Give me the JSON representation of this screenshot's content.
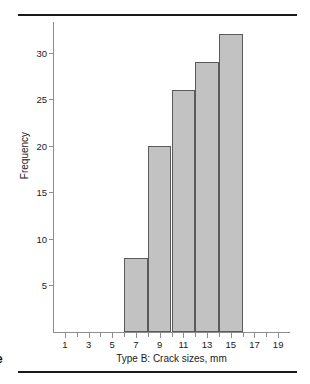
{
  "figure": {
    "margin_glyph": "e",
    "rule_color": "#1a1a1a"
  },
  "chart_data": {
    "type": "bar",
    "title": "",
    "subtitle": "",
    "xlabel": "Type B: Crack sizes, mm",
    "ylabel": "Frequency",
    "bin_edges": [
      6,
      8,
      10,
      12,
      14,
      16
    ],
    "bin_width": 2,
    "categories": [
      "6-8",
      "8-10",
      "10-12",
      "12-14",
      "14-16"
    ],
    "bin_centers": [
      7,
      9,
      11,
      13,
      15
    ],
    "values": [
      8,
      20,
      26,
      29,
      32
    ],
    "xlim": [
      0,
      20
    ],
    "ylim": [
      0,
      33
    ],
    "x_ticks": [
      1,
      2,
      3,
      4,
      5,
      6,
      7,
      8,
      9,
      10,
      11,
      12,
      13,
      14,
      15,
      16,
      17,
      18,
      19
    ],
    "x_tick_labels": [
      "1",
      "",
      "3",
      "",
      "5",
      "",
      "7",
      "",
      "9",
      "",
      "11",
      "",
      "13",
      "",
      "15",
      "",
      "17",
      "",
      "19"
    ],
    "y_ticks": [
      5,
      10,
      15,
      20,
      25,
      30
    ],
    "y_tick_labels": [
      "5",
      "10",
      "15",
      "20",
      "25",
      "30"
    ],
    "grid": false,
    "legend": null,
    "legend_position": "none",
    "bar_fill_color": "#c2c2c2",
    "bar_edge_color": "#5a5a5a",
    "axis_color": "#8c8c8c",
    "text_color": "#1a1a1a"
  }
}
